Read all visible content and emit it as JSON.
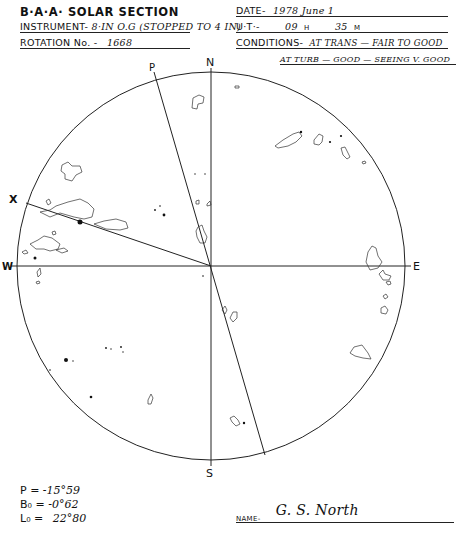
{
  "header_left": {
    "title": "B·A·A· SOLAR SECTION",
    "instrument_label": "INSTRUMENT-",
    "instrument_value": "8·IN O.G (STOPPED TO 4 IN)",
    "rotation_label": "ROTATION No. -",
    "rotation_value": "1668"
  },
  "header_right": {
    "date_label": "DATE-",
    "date_value": "1978  June  1",
    "ut_label": "U·T·-",
    "ut_hours": "09",
    "ut_h_unit": "H",
    "ut_minutes": "35",
    "ut_m_unit": "M",
    "conditions_label": "CONDITIONS-",
    "conditions_line1": "AT TRANS — FAIR TO GOOD",
    "conditions_line2": "AT TURB — GOOD — SEEING V. GOOD"
  },
  "disk": {
    "labels": {
      "north": "N",
      "south": "S",
      "east": "E",
      "west": "W",
      "p_axis": "P",
      "x_axis": "X"
    },
    "center": [
      211,
      266
    ],
    "radius": 194,
    "line_color": "#222222"
  },
  "parameters": {
    "p_label": "P =",
    "p_value": "-15°59",
    "b0_label": "B₀ =",
    "b0_value": "-0°62",
    "l0_label": "L₀ =",
    "l0_value": "22°80"
  },
  "observer": {
    "name_label": "NAME-",
    "name_value": "G. S. North"
  }
}
